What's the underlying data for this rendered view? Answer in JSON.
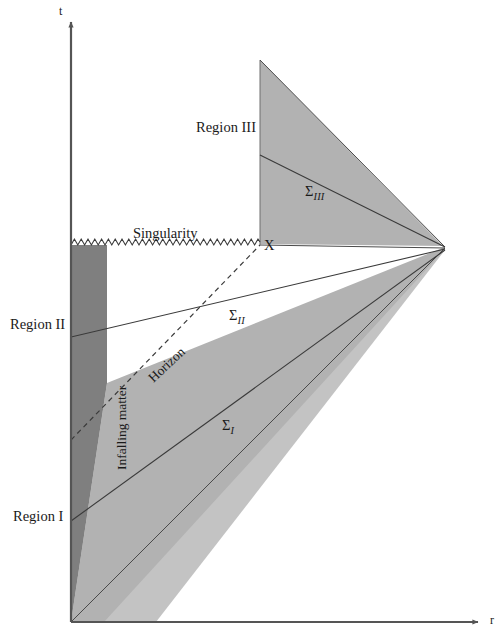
{
  "figure": {
    "type": "spacetime-diagram"
  },
  "axes": {
    "vertical_label": "t",
    "horizontal_label": "r",
    "origin": {
      "x": 71,
      "y": 622
    },
    "vertical_top": {
      "x": 71,
      "y": 19
    },
    "horizontal_right": {
      "x": 483,
      "y": 622
    }
  },
  "labels": {
    "region_one": "Region I",
    "region_two": "Region II",
    "region_three": "Region III",
    "singularity": "Singularity",
    "horizon": "Horizon",
    "infalling_matter": "Infalling matter",
    "point_x": "X",
    "sigma_one_prefix": "Σ",
    "sigma_one_sub": "I",
    "sigma_two_prefix": "Σ",
    "sigma_two_sub": "II",
    "sigma_three_prefix": "Σ",
    "sigma_three_sub": "III"
  },
  "colors": {
    "dark_shade": "#7f7f7f",
    "mid_shade": "#a8a8a8",
    "light_shade": "#c0c0c0",
    "line": "#3a3a3a",
    "axis": "#555555",
    "text": "#1a1a1a",
    "background": "#ffffff"
  },
  "geometry": {
    "vertex_right": {
      "x": 445,
      "y": 248
    },
    "singularity_y": 245,
    "singularity_x_start": 71,
    "singularity_x_end": 260,
    "region_three_triangle": [
      [
        260,
        60
      ],
      [
        260,
        243
      ],
      [
        443,
        245
      ]
    ],
    "dark_block_top": 245,
    "dark_block_right_x": 107,
    "infalling_band_left_top": {
      "x": 107,
      "y": 383
    },
    "sigma_one_left": {
      "x": 71,
      "y": 521
    },
    "sigma_two_left": {
      "x": 71,
      "y": 337
    },
    "sigma_three_left": {
      "x": 260,
      "y": 155
    },
    "horizon_start": {
      "x": 71,
      "y": 440
    },
    "horizon_end": {
      "x": 260,
      "y": 245
    }
  },
  "label_positions": {
    "t": {
      "x": 59,
      "y": 7
    },
    "r": {
      "x": 490,
      "y": 615
    },
    "region_one": {
      "x": 13,
      "y": 509
    },
    "region_two": {
      "x": 10,
      "y": 317
    },
    "region_three": {
      "x": 196,
      "y": 120
    },
    "singularity": {
      "x": 133,
      "y": 226
    },
    "point_x": {
      "x": 264,
      "y": 238
    },
    "sigma_one": {
      "x": 222,
      "y": 418
    },
    "sigma_two": {
      "x": 229,
      "y": 308
    },
    "sigma_three": {
      "x": 305,
      "y": 184
    },
    "horizon": {
      "x": 146,
      "y": 375
    },
    "infalling_matter": {
      "x": 115,
      "y": 470
    }
  }
}
